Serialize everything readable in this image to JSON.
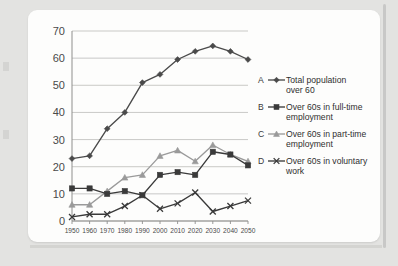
{
  "chart_data": {
    "type": "line",
    "title": "",
    "xlabel": "",
    "ylabel": "",
    "categories": [
      "1950",
      "1960",
      "1970",
      "1980",
      "1990",
      "2000",
      "2010",
      "2020",
      "2030",
      "2040",
      "2050"
    ],
    "ylim": [
      0,
      70
    ],
    "yticks": [
      0,
      10,
      20,
      30,
      40,
      50,
      60,
      70
    ],
    "grid": "horizontal",
    "legend_position": "right",
    "series": [
      {
        "key": "A",
        "name": "Total population over 60",
        "name_line1": "Total population",
        "name_line2": "over 60",
        "marker": "diamond",
        "color": "#4a4a4a",
        "values": [
          23,
          24,
          34,
          40,
          51,
          54,
          59.5,
          62.5,
          64.5,
          62.5,
          59.5
        ]
      },
      {
        "key": "B",
        "name": "Over 60s in full-time employment",
        "name_line1": "Over 60s in full-time",
        "name_line2": "employment",
        "marker": "square",
        "color": "#3a3a3a",
        "values": [
          12,
          12,
          10,
          11,
          9.5,
          17,
          18,
          17,
          25.5,
          24.5,
          20.5
        ]
      },
      {
        "key": "C",
        "name": "Over 60s in part-time employment",
        "name_line1": "Over 60s in part-time",
        "name_line2": "employment",
        "marker": "triangle",
        "color": "#9a9a9a",
        "values": [
          6,
          6,
          11,
          16,
          17,
          24,
          26,
          22,
          28,
          24.5,
          22
        ]
      },
      {
        "key": "D",
        "name": "Over 60s in voluntary work",
        "name_line1": "Over 60s in voluntary",
        "name_line2": "work",
        "marker": "cross",
        "color": "#3a3a3a",
        "values": [
          1.5,
          2.5,
          2.5,
          5.5,
          9.5,
          4.5,
          6.5,
          10.5,
          3.5,
          5.5,
          7.5
        ]
      }
    ]
  }
}
